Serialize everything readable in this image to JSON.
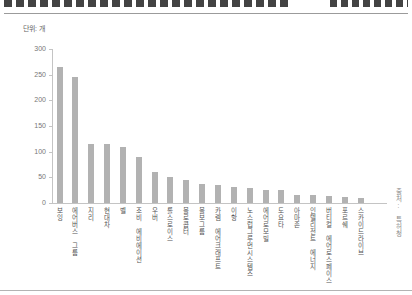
{
  "header": {
    "unit_label": "단위: 개",
    "source_label": "출처: 특허청"
  },
  "chart_data": {
    "type": "bar",
    "title": "",
    "unit": "단위: 개",
    "source": "출처: 특허청",
    "categories": [
      "보잉",
      "에어버스 그룹",
      "지리",
      "현대차",
      "벨",
      "조비 에비에이션",
      "우버",
      "롤스로이스",
      "볼로콥터",
      "볼보그룹",
      "카렘 에어크래프트",
      "이항",
      "노스럽그루먼시스템즈",
      "에어로모빌",
      "도요타",
      "아마존",
      "인텔리전트 에너지",
      "버티컬 에어로스페이스",
      "포르쉐",
      "스카이드라이브"
    ],
    "values": [
      265,
      245,
      115,
      115,
      110,
      90,
      60,
      50,
      45,
      38,
      35,
      32,
      30,
      25,
      25,
      16,
      15,
      14,
      12,
      10
    ],
    "ylim": [
      0,
      300
    ],
    "yticks": [
      0,
      50,
      100,
      150,
      200,
      250,
      300
    ],
    "bar_color": "#b2b2b2",
    "grid": false,
    "legend_position": "none"
  }
}
